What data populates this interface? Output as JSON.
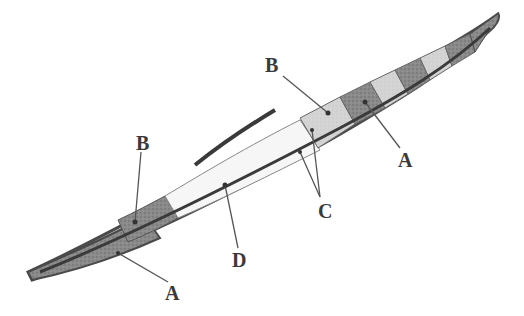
{
  "figure": {
    "type": "kayak hull structural diagram",
    "labels": [
      {
        "id": "label-b-left",
        "text": "B",
        "x": 136,
        "y": 133
      },
      {
        "id": "label-b-right",
        "text": "B",
        "x": 265,
        "y": 55
      },
      {
        "id": "label-a-right",
        "text": "A",
        "x": 398,
        "y": 150
      },
      {
        "id": "label-c",
        "text": "C",
        "x": 318,
        "y": 201
      },
      {
        "id": "label-d",
        "text": "D",
        "x": 232,
        "y": 250
      },
      {
        "id": "label-a-left",
        "text": "A",
        "x": 165,
        "y": 283
      }
    ],
    "colors": {
      "hull_outline": "#4a4a4a",
      "dark_panel": "#7a7a7a",
      "light_panel": "#cfcfcf",
      "cockpit_fill": "#f4f4f4",
      "leader_line": "#555555"
    }
  }
}
